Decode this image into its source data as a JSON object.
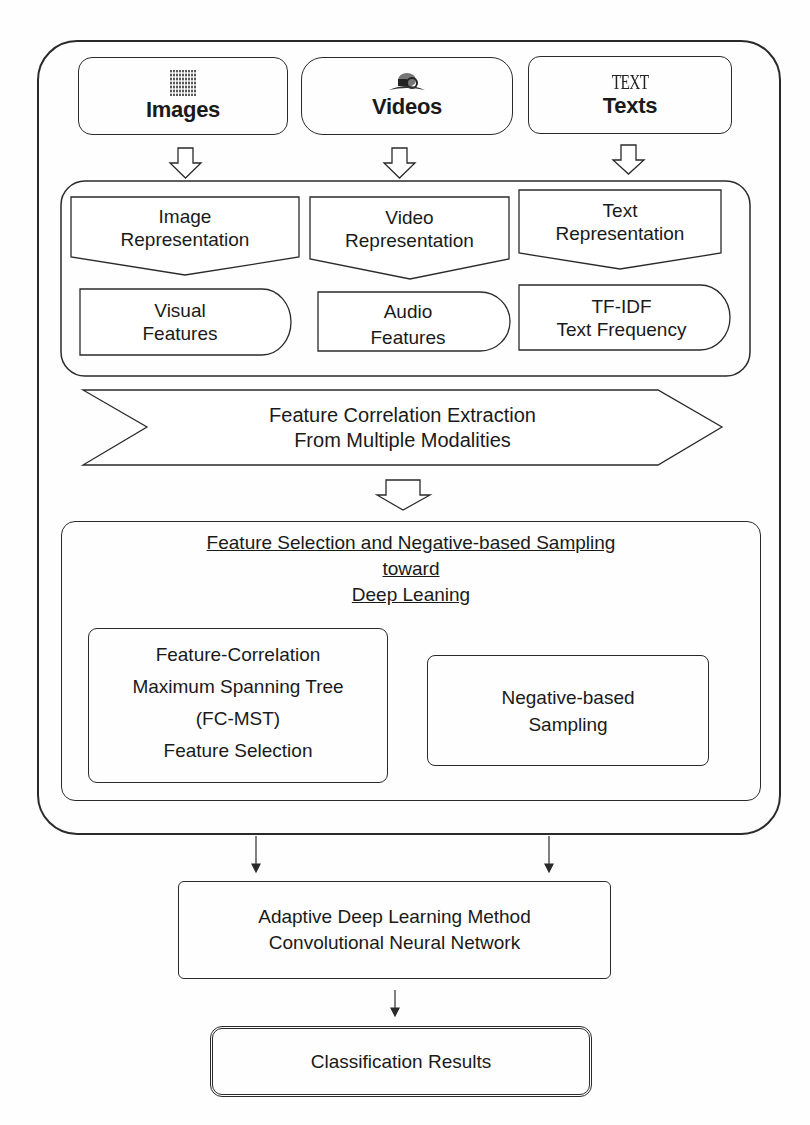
{
  "diagram": {
    "inputs": [
      {
        "label": "Images",
        "icon": "image-grid-icon"
      },
      {
        "label": "Videos",
        "icon": "film-reel-icon"
      },
      {
        "label": "Texts",
        "icon": "text-word-icon",
        "icon_text": "TEXT"
      }
    ],
    "representations": [
      {
        "title_line1": "Image",
        "title_line2": "Representation",
        "feature_line1": "Visual",
        "feature_line2": "Features"
      },
      {
        "title_line1": "Video",
        "title_line2": "Representation",
        "feature_line1": "Audio",
        "feature_line2": "Features"
      },
      {
        "title_line1": "Text",
        "title_line2": "Representation",
        "feature_line1": "TF-IDF",
        "feature_line2": "Text Frequency"
      }
    ],
    "correlation": {
      "line1": "Feature Correlation Extraction",
      "line2": "From Multiple Modalities"
    },
    "selection": {
      "heading_line1": "Feature Selection and Negative-based Sampling",
      "heading_line2": "toward",
      "heading_line3": "Deep Leaning",
      "fcmst": {
        "line1": "Feature-Correlation",
        "line2": "Maximum Spanning Tree",
        "line3": "(FC-MST)",
        "line4": "Feature Selection"
      },
      "negative": {
        "line1": "Negative-based",
        "line2": "Sampling"
      }
    },
    "cnn": {
      "line1": "Adaptive Deep Learning Method",
      "line2": "Convolutional Neural Network"
    },
    "result": {
      "label": "Classification Results"
    }
  },
  "colors": {
    "stroke": "#2a2a2a",
    "text": "#1a1a1a",
    "background": "#fefefe"
  }
}
